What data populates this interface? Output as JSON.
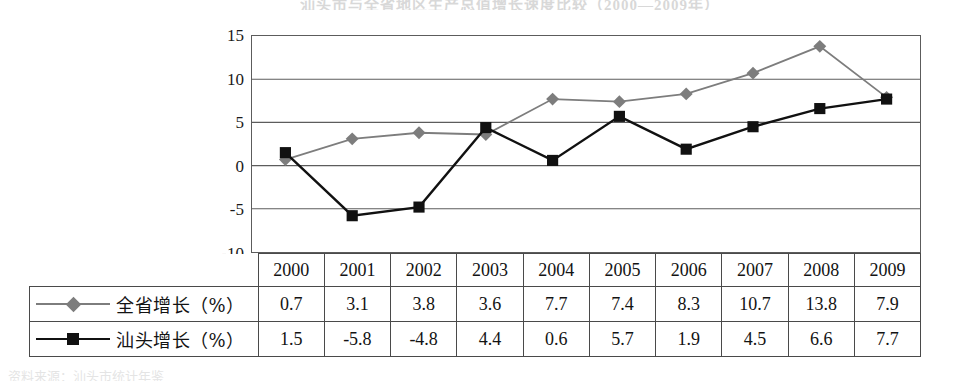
{
  "figure": {
    "top_title_fragment": "汕头市与全省地区生产总值增长速度比较（2000—2009年）",
    "bottom_caption_fragment": "资料来源：汕头市统计年鉴"
  },
  "chart_data": {
    "type": "line",
    "title": "",
    "xlabel": "",
    "ylabel": "",
    "categories": [
      "2000",
      "2001",
      "2002",
      "2003",
      "2004",
      "2005",
      "2006",
      "2007",
      "2008",
      "2009"
    ],
    "ylim": [
      -10,
      15
    ],
    "yticks": [
      15,
      10,
      5,
      0,
      -5,
      -10
    ],
    "grid": true,
    "legend_position": "table-left",
    "series": [
      {
        "name": "全省增长（%）",
        "marker": "diamond",
        "color": "#7d7d7d",
        "values": [
          0.7,
          3.1,
          3.8,
          3.6,
          7.7,
          7.4,
          8.3,
          10.7,
          13.8,
          7.9
        ]
      },
      {
        "name": "汕头增长（%）",
        "marker": "square",
        "color": "#111111",
        "values": [
          1.5,
          -5.8,
          -4.8,
          4.4,
          0.6,
          5.7,
          1.9,
          4.5,
          6.6,
          7.7
        ]
      }
    ]
  },
  "table": {
    "header_label": "",
    "rows": [
      {
        "label": "全省增长（%）",
        "marker": "diamond",
        "cells": [
          "0.7",
          "3.1",
          "3.8",
          "3.6",
          "7.7",
          "7.4",
          "8.3",
          "10.7",
          "13.8",
          "7.9"
        ]
      },
      {
        "label": "汕头增长（%）",
        "marker": "square",
        "cells": [
          "1.5",
          "-5.8",
          "-4.8",
          "4.4",
          "0.6",
          "5.7",
          "1.9",
          "4.5",
          "6.6",
          "7.7"
        ]
      }
    ]
  },
  "colors": {
    "series_province": "#7d7d7d",
    "series_shantou": "#111111",
    "grid": "#5c5c5c",
    "border": "#4a4a4a"
  }
}
